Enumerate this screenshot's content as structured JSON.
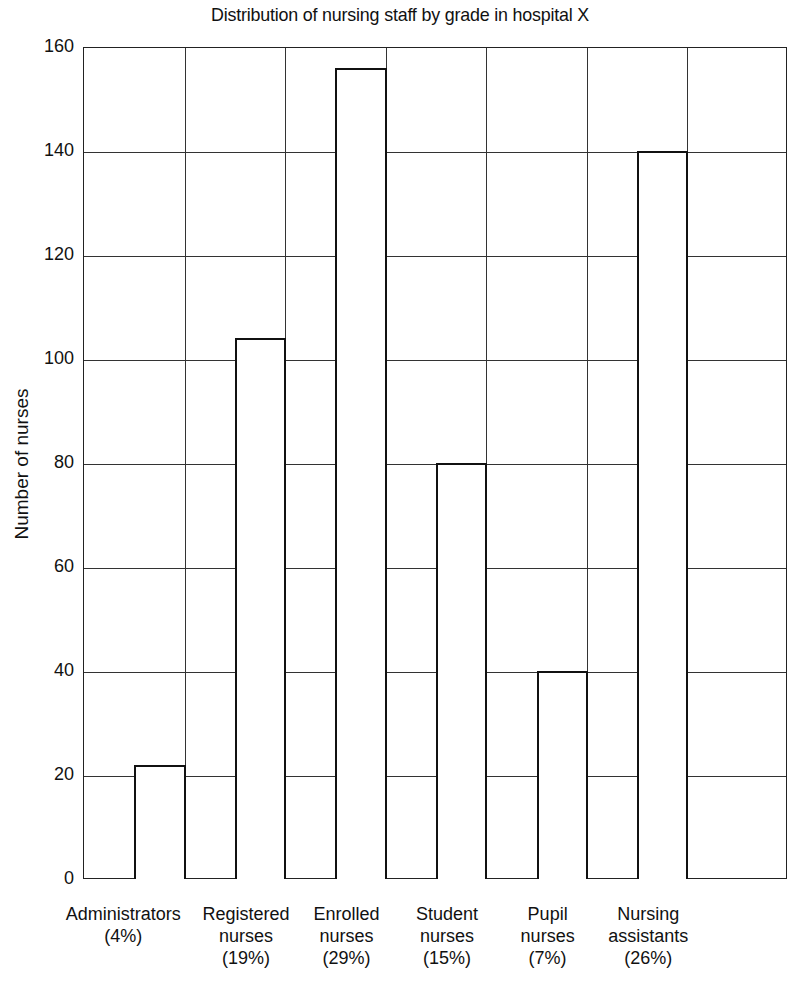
{
  "chart_data": {
    "type": "bar",
    "title": "Distribution of nursing staff by grade in hospital X",
    "xlabel": "",
    "ylabel": "Number of nurses",
    "ylim": [
      0,
      160
    ],
    "yticks": [
      0,
      20,
      40,
      60,
      80,
      100,
      120,
      140,
      160
    ],
    "grid": true,
    "categories": [
      "Administrators",
      "Registered nurses",
      "Enrolled nurses",
      "Student nurses",
      "Pupil nurses",
      "Nursing assistants"
    ],
    "percentages": [
      "(4%)",
      "(19%)",
      "(29%)",
      "(15%)",
      "(7%)",
      "(26%)"
    ],
    "values": [
      22,
      104,
      156,
      80,
      40,
      140
    ]
  },
  "labels": [
    {
      "lines": [
        "Administrators",
        "(4%)"
      ]
    },
    {
      "lines": [
        "Registered",
        "nurses",
        "(19%)"
      ]
    },
    {
      "lines": [
        "Enrolled",
        "nurses",
        "(29%)"
      ]
    },
    {
      "lines": [
        "Student",
        "nurses",
        "(15%)"
      ]
    },
    {
      "lines": [
        "Pupil",
        "nurses",
        "(7%)"
      ]
    },
    {
      "lines": [
        "Nursing",
        "assistants",
        "(26%)"
      ]
    }
  ]
}
